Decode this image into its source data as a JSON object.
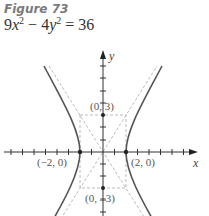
{
  "figure": {
    "label": "Figure 73",
    "equation": {
      "coef_x": "9",
      "var_x": "x",
      "exp_x": "2",
      "minus": " − ",
      "coef_y": "4",
      "var_y": "y",
      "exp_y": "2",
      "equals": " = ",
      "rhs": "36"
    }
  },
  "graph": {
    "axis_x_label": "x",
    "axis_y_label": "y",
    "points": [
      {
        "label": "(0, 3)"
      },
      {
        "label": "(0, −3)"
      },
      {
        "label": "(−2, 0)"
      },
      {
        "label": "(2, 0)"
      }
    ],
    "colors": {
      "curve": "#555555",
      "asymptote": "#aaaaaa",
      "axis": "#333333"
    }
  }
}
